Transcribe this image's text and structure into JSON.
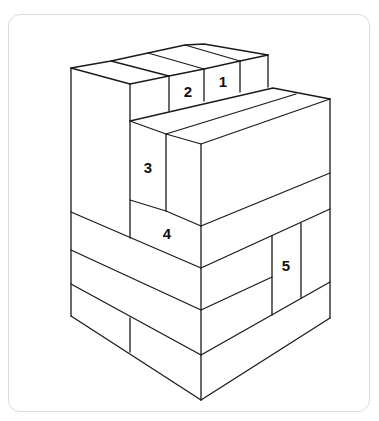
{
  "diagram": {
    "colors": {
      "line": "#1a1a1a",
      "frame": "#dcdcdc",
      "background": "#ffffff"
    },
    "labels": [
      {
        "id": "1",
        "text": "1",
        "x": 223,
        "y": 81
      },
      {
        "id": "2",
        "text": "2",
        "x": 188,
        "y": 91
      },
      {
        "id": "3",
        "text": "3",
        "x": 148,
        "y": 167
      },
      {
        "id": "4",
        "text": "4",
        "x": 167,
        "y": 233
      },
      {
        "id": "5",
        "text": "5",
        "x": 285,
        "y": 265
      }
    ]
  }
}
